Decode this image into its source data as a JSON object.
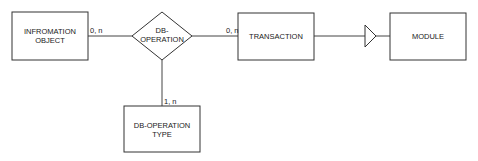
{
  "diagram": {
    "type": "entity-relationship",
    "entities": [
      {
        "id": "information_object",
        "line1": "INFROMATION",
        "line2": "OBJECT"
      },
      {
        "id": "transaction",
        "line1": "TRANSACTION"
      },
      {
        "id": "module",
        "line1": "MODULE"
      },
      {
        "id": "db_operation_type",
        "line1": "DB-OPERATION",
        "line2": "TYPE"
      }
    ],
    "relationships": [
      {
        "id": "db_operation",
        "line1": "DB-",
        "line2": "OPERATION"
      }
    ],
    "cardinalities": {
      "information_object_to_db_operation": "0, n",
      "db_operation_to_transaction": "0, n",
      "db_operation_to_db_operation_type": "1, n"
    },
    "connections": [
      {
        "from": "information_object",
        "to": "db_operation",
        "cardinality": "0, n"
      },
      {
        "from": "db_operation",
        "to": "transaction",
        "cardinality": "0, n"
      },
      {
        "from": "db_operation",
        "to": "db_operation_type",
        "cardinality": "1, n"
      },
      {
        "from": "transaction",
        "to": "module",
        "symbol": "inheritance-triangle"
      }
    ],
    "colors": {
      "stroke": "#333333",
      "text": "#1a1a1a",
      "background": "#ffffff"
    }
  }
}
